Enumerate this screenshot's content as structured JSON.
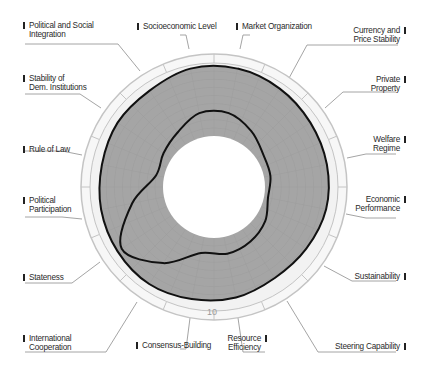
{
  "chart_data": {
    "type": "radar",
    "title": "",
    "scale": {
      "min": 1,
      "max": 10,
      "tick_label": "10"
    },
    "axes": [
      "Market Organization",
      "Currency and Price Stability",
      "Private Property",
      "Welfare Regime",
      "Economic Performance",
      "Sustainability",
      "Steering Capability",
      "Resource Efficiency",
      "Consensus-Building",
      "International Cooperation",
      "Stateness",
      "Political Participation",
      "Rule of Law",
      "Stability of Dem. Institutions",
      "Political and Social Integration",
      "Socioeconomic Level"
    ],
    "series": [
      {
        "name": "Outer (maximum)",
        "values": [
          9.6,
          9.3,
          9.0,
          8.9,
          8.8,
          8.4,
          8.2,
          8.6,
          8.8,
          9.1,
          9.0,
          8.9,
          8.8,
          9.0,
          9.0,
          9.6
        ]
      },
      {
        "name": "Inner (minimum)",
        "values": [
          4.0,
          3.0,
          2.0,
          1.8,
          1.5,
          2.3,
          2.8,
          3.1,
          3.0,
          6.0,
          8.4,
          5.0,
          2.0,
          2.2,
          2.8,
          4.0
        ]
      }
    ],
    "colors": {
      "fill": "#a6a6a6",
      "outline": "#111111",
      "core": "#ffffff",
      "ring": "#c8c8c8",
      "grid": "#bdbdbd"
    }
  },
  "labels": {
    "political_social_integration": [
      "Political and Social",
      "Integration"
    ],
    "socioeconomic_level": "Socioeconomic Level",
    "market_organization": "Market Organization",
    "currency_price_stability": [
      "Currency and",
      "Price Stability"
    ],
    "stability_dem_institutions": [
      "Stability of",
      "Dem. Institutions"
    ],
    "private_property": [
      "Private",
      "Property"
    ],
    "rule_of_law": "Rule of Law",
    "welfare_regime": [
      "Welfare",
      "Regime"
    ],
    "political_participation": [
      "Political",
      "Participation"
    ],
    "economic_performance": [
      "Economic",
      "Performance"
    ],
    "stateness": "Stateness",
    "sustainability": "Sustainability",
    "international_cooperation": [
      "International",
      "Cooperation"
    ],
    "consensus_building": "Consensus-Building",
    "resource_efficiency": [
      "Resource",
      "Efficiency"
    ],
    "steering_capability": "Steering Capability"
  }
}
